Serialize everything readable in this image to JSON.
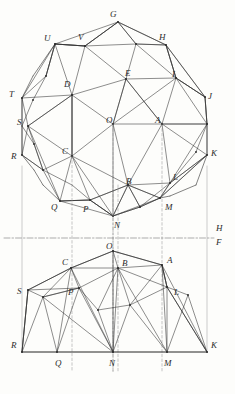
{
  "figure": {
    "ground_line_labels": {
      "horizontal": "H",
      "frontal": "F"
    },
    "stroke_color": "#2f2f2f",
    "dash_color": "#8c8c8c",
    "background": "#fdfdfb"
  },
  "labels": {
    "plan": [
      {
        "text": "G",
        "x": 110,
        "y": 10
      },
      {
        "text": "U",
        "x": 44,
        "y": 34
      },
      {
        "text": "V",
        "x": 78,
        "y": 33
      },
      {
        "text": "H",
        "x": 159,
        "y": 33
      },
      {
        "text": "E",
        "x": 125,
        "y": 69
      },
      {
        "text": "I",
        "x": 172,
        "y": 70
      },
      {
        "text": "D",
        "x": 64,
        "y": 80
      },
      {
        "text": "T",
        "x": 9,
        "y": 90
      },
      {
        "text": "J",
        "x": 208,
        "y": 92
      },
      {
        "text": "O",
        "x": 106,
        "y": 116
      },
      {
        "text": "A",
        "x": 155,
        "y": 116
      },
      {
        "text": "S",
        "x": 17,
        "y": 118
      },
      {
        "text": "K",
        "x": 211,
        "y": 149
      },
      {
        "text": "R",
        "x": 11,
        "y": 152
      },
      {
        "text": "C",
        "x": 62,
        "y": 147
      },
      {
        "text": "B",
        "x": 126,
        "y": 177
      },
      {
        "text": "L",
        "x": 173,
        "y": 173
      },
      {
        "text": "Q",
        "x": 51,
        "y": 203
      },
      {
        "text": "P",
        "x": 83,
        "y": 205
      },
      {
        "text": "M",
        "x": 165,
        "y": 203
      },
      {
        "text": "N",
        "x": 114,
        "y": 221
      }
    ],
    "elevation": [
      {
        "text": "O",
        "x": 106,
        "y": 242
      },
      {
        "text": "C",
        "x": 62,
        "y": 258
      },
      {
        "text": "B",
        "x": 122,
        "y": 259
      },
      {
        "text": "A",
        "x": 167,
        "y": 256
      },
      {
        "text": "S",
        "x": 17,
        "y": 287
      },
      {
        "text": "P",
        "x": 68,
        "y": 288
      },
      {
        "text": "L",
        "x": 174,
        "y": 288
      },
      {
        "text": "R",
        "x": 11,
        "y": 341
      },
      {
        "text": "K",
        "x": 211,
        "y": 341
      },
      {
        "text": "Q",
        "x": 55,
        "y": 359
      },
      {
        "text": "N",
        "x": 109,
        "y": 359
      },
      {
        "text": "M",
        "x": 164,
        "y": 359
      }
    ],
    "ground": [
      {
        "text": "H",
        "x": 216,
        "y": 224
      },
      {
        "text": "F",
        "x": 216,
        "y": 238
      }
    ]
  },
  "geometry": {
    "plan_points": {
      "G": [
        118,
        22
      ],
      "U": [
        55,
        44
      ],
      "V": [
        85,
        46
      ],
      "W": [
        136,
        44
      ],
      "H": [
        166,
        45
      ],
      "E": [
        126,
        79
      ],
      "I": [
        176,
        78
      ],
      "D": [
        72,
        95
      ],
      "T": [
        22,
        98
      ],
      "J": [
        205,
        97
      ],
      "O": [
        113,
        124
      ],
      "A": [
        162,
        124
      ],
      "S": [
        28,
        126
      ],
      "X": [
        207,
        124
      ],
      "C": [
        72,
        156
      ],
      "K": [
        207,
        155
      ],
      "R": [
        22,
        155
      ],
      "B": [
        128,
        185
      ],
      "L": [
        170,
        183
      ],
      "Q": [
        60,
        201
      ],
      "P": [
        90,
        200
      ],
      "M": [
        160,
        198
      ],
      "N": [
        113,
        216
      ],
      "D2": [
        46,
        76
      ],
      "E2": [
        43,
        170
      ],
      "F2": [
        140,
        207
      ]
    },
    "elevation_points": {
      "O": [
        113,
        251
      ],
      "C": [
        71,
        268
      ],
      "B": [
        118,
        268
      ],
      "A": [
        162,
        265
      ],
      "S": [
        28,
        290
      ],
      "P": [
        79,
        288
      ],
      "L": [
        167,
        287
      ],
      "R": [
        22,
        352
      ],
      "Q": [
        57,
        352
      ],
      "N": [
        113,
        352
      ],
      "M": [
        167,
        352
      ],
      "K": [
        207,
        352
      ]
    },
    "ground_line_y": 238,
    "left_border_x": 22,
    "right_border_x": 207
  }
}
